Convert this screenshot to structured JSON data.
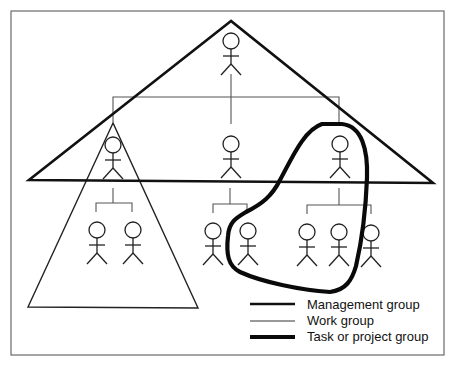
{
  "diagram": {
    "type": "organizational-groups",
    "groups": {
      "management": {
        "shape": "large-triangle",
        "members": [
          "top",
          "left-mid",
          "center-mid",
          "right-mid"
        ]
      },
      "work": {
        "shape": "small-triangle",
        "members": [
          "left-mid",
          "left-sub-1",
          "left-sub-2"
        ]
      },
      "task": {
        "shape": "closed-curve",
        "members": [
          "right-mid",
          "center-sub-2",
          "right-sub-1",
          "right-sub-2"
        ]
      }
    },
    "people_count": 11
  },
  "legend": {
    "items": [
      {
        "label": "Management group",
        "line": "medium"
      },
      {
        "label": "Work group",
        "line": "thin"
      },
      {
        "label": "Task or project group",
        "line": "thick"
      }
    ]
  },
  "colors": {
    "background": "#ffffff",
    "frame": "#6a6a6a",
    "lines": "#111111"
  }
}
